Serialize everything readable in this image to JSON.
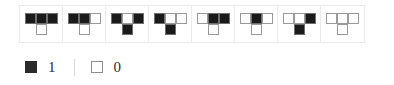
{
  "figure": {
    "type": "tetromino-pattern-strip",
    "shape": "T-tetromino",
    "cell_positions": [
      "top-left",
      "top-center",
      "top-right",
      "bottom-center"
    ],
    "tiles": [
      {
        "index": 1,
        "code": "1110",
        "cells": [
          1,
          1,
          1,
          0
        ]
      },
      {
        "index": 2,
        "code": "1100",
        "cells": [
          1,
          1,
          0,
          0
        ]
      },
      {
        "index": 3,
        "code": "1011",
        "cells": [
          1,
          0,
          1,
          1
        ]
      },
      {
        "index": 4,
        "code": "1001",
        "cells": [
          1,
          0,
          0,
          1
        ]
      },
      {
        "index": 5,
        "code": "0110",
        "cells": [
          0,
          1,
          1,
          0
        ]
      },
      {
        "index": 6,
        "code": "0100",
        "cells": [
          0,
          1,
          0,
          0
        ]
      },
      {
        "index": 7,
        "code": "0011",
        "cells": [
          0,
          0,
          1,
          1
        ]
      },
      {
        "index": 8,
        "code": "0000",
        "cells": [
          0,
          0,
          0,
          0
        ]
      }
    ]
  },
  "legend": {
    "filled": {
      "swatch": "filled-square",
      "label": "1"
    },
    "empty": {
      "swatch": "empty-square",
      "label": "0"
    },
    "divider": "|"
  },
  "colors": {
    "filled": "#1a1a1a",
    "empty": "#ffffff",
    "cell_border": "#9a9a9a",
    "container_border": "#ebebeb",
    "text": "#2b2b2b",
    "background": "#ffffff"
  }
}
